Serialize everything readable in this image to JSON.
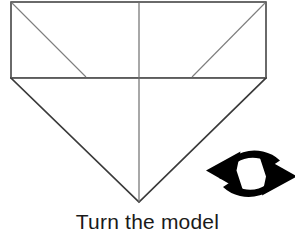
{
  "figure": {
    "kind": "origami-instruction-diagram",
    "caption": "Turn the model",
    "background_color": "#ffffff",
    "line_color": "#3a3a3a",
    "icon_color": "#000000"
  },
  "diagram": {
    "name": "folded-paper-shape",
    "shapes": [
      {
        "name": "upper-rectangle",
        "type": "rect",
        "points": "11,2 266,2 266,78 11,78"
      },
      {
        "name": "lower-triangle",
        "type": "polygon",
        "points": "11,78 266,78 139,202"
      }
    ],
    "crease_lines": [
      {
        "name": "crease-diagonal-left",
        "x1": 11,
        "y1": 2,
        "x2": 86,
        "y2": 77
      },
      {
        "name": "crease-diagonal-right",
        "x1": 266,
        "y1": 2,
        "x2": 192,
        "y2": 77
      },
      {
        "name": "crease-vertical-center",
        "x1": 139,
        "y1": 2,
        "x2": 139,
        "y2": 202
      },
      {
        "name": "crease-horizontal-middle",
        "x1": 11,
        "y1": 77,
        "x2": 266,
        "y2": 77
      }
    ]
  },
  "turn_over_icon": {
    "name": "turn-over-circular-arrows-icon",
    "label": "turn-over-icon",
    "meaning": "Turn the model over",
    "arrow_count": 2,
    "clipped_at_right_edge": true
  }
}
